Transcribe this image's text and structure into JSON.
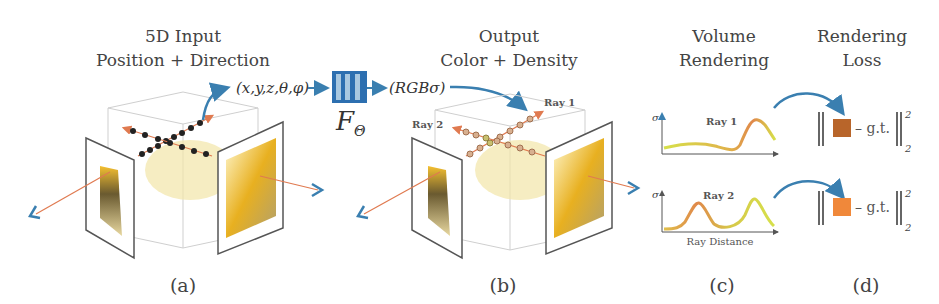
{
  "panels": {
    "a": {
      "title_line1": "5D Input",
      "title_line2": "Position + Direction",
      "caption": "(a)"
    },
    "b": {
      "title_line1": "Output",
      "title_line2": "Color + Density",
      "caption": "(b)",
      "ray1_label": "Ray 1",
      "ray2_label": "Ray 2"
    },
    "c": {
      "title_line1": "Volume",
      "title_line2": "Rendering",
      "caption": "(c)",
      "ray1_label": "Ray 1",
      "ray2_label": "Ray 2",
      "y_axis_label": "σ",
      "x_axis_label": "Ray Distance"
    },
    "d": {
      "title_line1": "Rendering",
      "title_line2": "Loss",
      "caption": "(d)",
      "gt_label": "– g.t.",
      "sup": "2",
      "sub": "2"
    }
  },
  "network": {
    "input_label": "(x,y,z,θ,φ)",
    "output_label": "(RGBσ)",
    "function_label": "F",
    "function_subscript": "Θ"
  },
  "colors": {
    "arrow_blue": "#3a7fb0",
    "ray_orange": "#e07a50",
    "network_blue": "#2d6fb0",
    "network_fill": "#a9c8e0",
    "pred_color_1": "#b8652a",
    "pred_color_2": "#f0883a",
    "curve_yellow": "#d6e04a",
    "curve_orange": "#e0884a"
  }
}
